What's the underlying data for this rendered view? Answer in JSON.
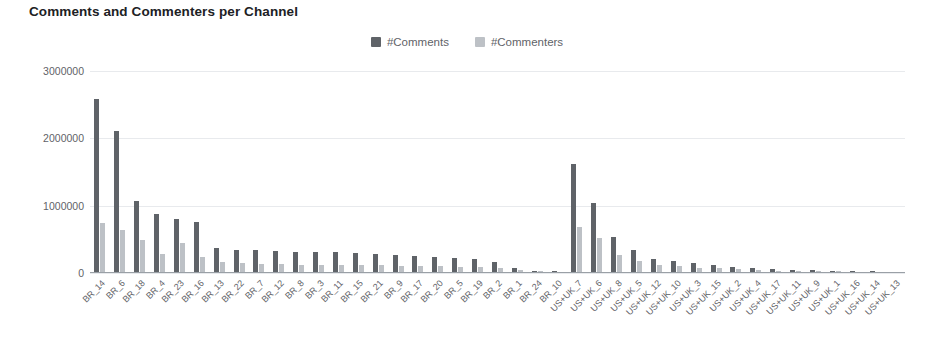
{
  "chart_data": {
    "type": "bar",
    "title": "Comments and Commenters per Channel",
    "xlabel": "",
    "ylabel": "",
    "ylim": [
      0,
      3000000
    ],
    "yticks": [
      0,
      1000000,
      2000000,
      3000000
    ],
    "ytick_labels": [
      "0",
      "1000000",
      "2000000",
      "3000000"
    ],
    "grid": true,
    "legend_position": "top-center",
    "colors": {
      "comments": "#5f6368",
      "commenters": "#bdc1c6"
    },
    "categories": [
      "BR_14",
      "BR_6",
      "BR_18",
      "BR_4",
      "BR_23",
      "BR_16",
      "BR_13",
      "BR_22",
      "BR_7",
      "BR_12",
      "BR_8",
      "BR_3",
      "BR_11",
      "BR_15",
      "BR_21",
      "BR_9",
      "BR_17",
      "BR_20",
      "BR_5",
      "BR_19",
      "BR_2",
      "BR_1",
      "BR_24",
      "BR_10",
      "US+UK_7",
      "US+UK_6",
      "US+UK_8",
      "US+UK_5",
      "US+UK_12",
      "US+UK_10",
      "US+UK_3",
      "US+UK_15",
      "US+UK_2",
      "US+UK_4",
      "US+UK_17",
      "US+UK_11",
      "US+UK_9",
      "US+UK_1",
      "US+UK_16",
      "US+UK_14",
      "US+UK_13"
    ],
    "series": [
      {
        "name": "#Comments",
        "values": [
          2570000,
          2090000,
          1060000,
          860000,
          790000,
          740000,
          350000,
          330000,
          320000,
          310000,
          300000,
          300000,
          290000,
          280000,
          270000,
          250000,
          240000,
          220000,
          210000,
          200000,
          150000,
          60000,
          20000,
          15000,
          1600000,
          1030000,
          520000,
          330000,
          200000,
          170000,
          130000,
          110000,
          80000,
          60000,
          45000,
          35000,
          25000,
          18000,
          12000,
          8000,
          5000
        ]
      },
      {
        "name": "#Commenters",
        "values": [
          730000,
          620000,
          480000,
          270000,
          430000,
          230000,
          150000,
          130000,
          120000,
          120000,
          110000,
          110000,
          110000,
          105000,
          100000,
          95000,
          90000,
          85000,
          80000,
          75000,
          55000,
          25000,
          8000,
          6000,
          670000,
          500000,
          250000,
          170000,
          100000,
          85000,
          65000,
          55000,
          40000,
          30000,
          22000,
          17000,
          12000,
          9000,
          6000,
          4000,
          2500
        ]
      }
    ]
  },
  "legend": [
    {
      "label": "#Comments",
      "color": "#5f6368"
    },
    {
      "label": "#Commenters",
      "color": "#bdc1c6"
    }
  ]
}
